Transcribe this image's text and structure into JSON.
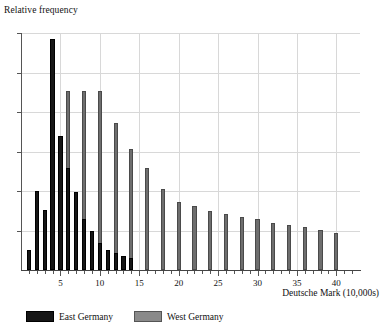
{
  "chart_data": {
    "type": "bar",
    "title": "",
    "xlabel": "Deutsche Mark (10,000s)",
    "ylabel": "Relative frequency",
    "xlim": [
      0,
      43
    ],
    "ylim": [
      0,
      1
    ],
    "grid": true,
    "legend_position": "bottom-left",
    "x_major_ticks": [
      5,
      10,
      15,
      20,
      25,
      30,
      35,
      40
    ],
    "x_major_tick_labels": [
      "5",
      "10",
      "15",
      "20",
      "25",
      "30",
      "35",
      "40"
    ],
    "x_minor_tick_step": 1,
    "y_tick_count": 6,
    "y_tick_labels": [],
    "series": [
      {
        "name": "East Germany",
        "color": "#161616",
        "x": [
          1,
          2,
          3,
          4,
          5,
          6,
          7,
          8,
          9,
          10,
          11,
          12,
          13,
          14
        ],
        "values": [
          0.085,
          0.335,
          0.255,
          0.975,
          0.565,
          0.43,
          0.33,
          0.215,
          0.165,
          0.115,
          0.085,
          0.07,
          0.06,
          0.05
        ]
      },
      {
        "name": "West Germany",
        "color": "#6e6e6e",
        "x": [
          2,
          4,
          6,
          8,
          10,
          12,
          14,
          16,
          18,
          20,
          22,
          24,
          26,
          28,
          30,
          32,
          34,
          36,
          38,
          40
        ],
        "values": [
          0.24,
          0.55,
          0.755,
          0.755,
          0.755,
          0.62,
          0.51,
          0.43,
          0.34,
          0.285,
          0.27,
          0.25,
          0.235,
          0.225,
          0.215,
          0.2,
          0.19,
          0.18,
          0.168,
          0.158
        ]
      }
    ]
  },
  "legend": {
    "items": [
      {
        "label": "East Germany",
        "key": "east"
      },
      {
        "label": "West Germany",
        "key": "west"
      }
    ]
  }
}
